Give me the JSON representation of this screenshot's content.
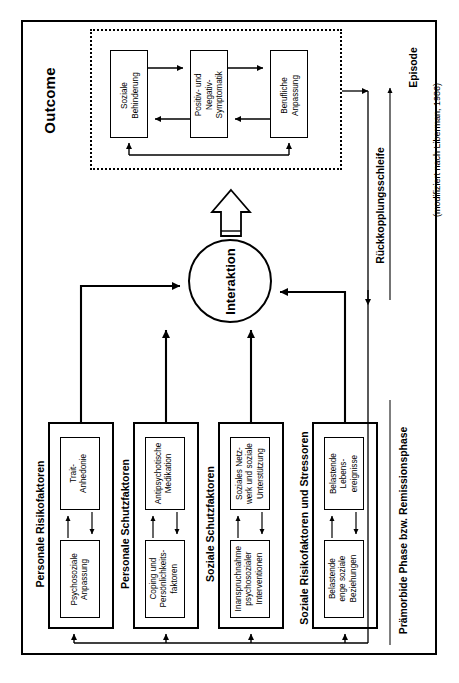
{
  "figure": {
    "outer_frame": true,
    "caption": ""
  },
  "outcome": {
    "label": "Outcome",
    "boxes": [
      {
        "name": "soziale-behinderung",
        "line1": "Soziale",
        "line2": "Behinderung",
        "line3": ""
      },
      {
        "name": "positiv-negativ-symptomatik",
        "line1": "Positiv- und",
        "line2": "Negativ-",
        "line3": "Symptomatik"
      },
      {
        "name": "berufliche-anpassung",
        "line1": "Berufliche",
        "line2": "Anpassung",
        "line3": ""
      }
    ]
  },
  "interaction": {
    "label": "Interaktion"
  },
  "groups": [
    {
      "id": "personale-risikofaktoren",
      "label": "Personale Risikofaktoren",
      "top_box": {
        "line1": "Trait-",
        "line2": "Anhedonie",
        "line3": ""
      },
      "bottom_box": {
        "line1": "Psychosoziale",
        "line2": "Anpassung",
        "line3": ""
      }
    },
    {
      "id": "personale-schutzfaktoren",
      "label": "Personale Schutzfaktoren",
      "top_box": {
        "line1": "Antipsychotische",
        "line2": "Medikation",
        "line3": ""
      },
      "bottom_box": {
        "line1": "Coping und",
        "line2": "Persönlichkeits-",
        "line3": "faktoren"
      }
    },
    {
      "id": "soziale-schutzfaktoren",
      "label": "Soziale Schutzfaktoren",
      "top_box": {
        "line1": "Soziales Netz-",
        "line2": "werk und soziale",
        "line3": "Unterstützung"
      },
      "bottom_box": {
        "line1": "Inanspruchnahme",
        "line2": "psychosozialer",
        "line3": "Interventionen"
      }
    },
    {
      "id": "soziale-risikofaktoren-stressoren",
      "label": "Soziale Risikofaktoren und Stressoren",
      "top_box": {
        "line1": "Belastende",
        "line2": "Lebens-",
        "line3": "ereignisse"
      },
      "bottom_box": {
        "line1": "Belastende",
        "line2": "enge soziale",
        "line3": "Beziehungen"
      }
    }
  ],
  "side_labels": {
    "feedback_loop": "Rückkopplungsschleife",
    "episode": "Episode",
    "premorbid": "Prämorbide Phase bzw. Remissionsphase",
    "credit": "(modifiziert nach Liberman, 1986)"
  },
  "colors": {
    "stroke": "#000000",
    "background": "#ffffff"
  }
}
